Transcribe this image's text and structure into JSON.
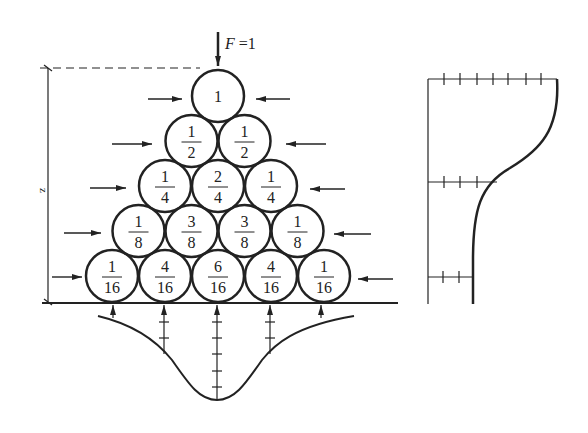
{
  "load": {
    "label": "F =1",
    "symbol": "F",
    "value": "1"
  },
  "height_label": "z",
  "rows": [
    [
      {
        "num": "1",
        "den": ""
      }
    ],
    [
      {
        "num": "1",
        "den": "2"
      },
      {
        "num": "1",
        "den": "2"
      }
    ],
    [
      {
        "num": "1",
        "den": "4"
      },
      {
        "num": "2",
        "den": "4"
      },
      {
        "num": "1",
        "den": "4"
      }
    ],
    [
      {
        "num": "1",
        "den": "8"
      },
      {
        "num": "3",
        "den": "8"
      },
      {
        "num": "3",
        "den": "8"
      },
      {
        "num": "1",
        "den": "8"
      }
    ],
    [
      {
        "num": "1",
        "den": "16"
      },
      {
        "num": "4",
        "den": "16"
      },
      {
        "num": "6",
        "den": "16"
      },
      {
        "num": "4",
        "den": "16"
      },
      {
        "num": "1",
        "den": "16"
      }
    ]
  ],
  "base_reaction_ticks": [
    1,
    4,
    6,
    4,
    1
  ],
  "side_profile_ticks": {
    "top": 7,
    "middle": 3,
    "bottom": 2
  },
  "colors": {
    "ink": "#222222",
    "background": "#ffffff"
  }
}
